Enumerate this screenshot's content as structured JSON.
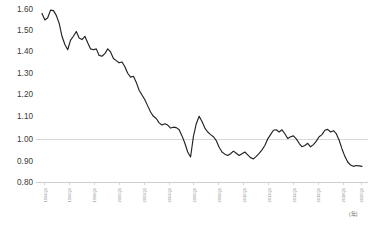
{
  "chart_data": {
    "type": "line",
    "title": "",
    "subtitle": "",
    "xlabel": "(年)",
    "ylabel": "",
    "ylim": [
      0.8,
      1.6
    ],
    "ytick_labels": [
      "1.60",
      "1.50",
      "1.40",
      "1.30",
      "1.20",
      "1.10",
      "1.00",
      "0.90",
      "0.80"
    ],
    "ytick_values": [
      1.6,
      1.5,
      1.4,
      1.3,
      1.2,
      1.1,
      1.0,
      0.9,
      0.8
    ],
    "gridlines": {
      "horizontal_at": [
        1.0,
        0.8
      ],
      "vertical": false
    },
    "legend": {
      "visible": false,
      "position": "none",
      "entries": []
    },
    "xtick_labels": [
      "1994Q1",
      "1996Q1",
      "1998Q1",
      "2000Q1",
      "2002Q1",
      "2004Q1",
      "2006Q1",
      "2008Q1",
      "2010Q1",
      "2012Q1",
      "2014Q1",
      "2016Q1",
      "2018Q1",
      "2020Q1"
    ],
    "xtick_rotation_deg": -90,
    "x_unit_marker": "(年)",
    "series": [
      {
        "name": "index",
        "color": "#222222",
        "x": [
          "1994Q1",
          "1994Q2",
          "1994Q3",
          "1994Q4",
          "1995Q1",
          "1995Q2",
          "1995Q3",
          "1995Q4",
          "1996Q1",
          "1996Q2",
          "1996Q3",
          "1996Q4",
          "1997Q1",
          "1997Q2",
          "1997Q3",
          "1997Q4",
          "1998Q1",
          "1998Q2",
          "1998Q3",
          "1998Q4",
          "1999Q1",
          "1999Q2",
          "1999Q3",
          "1999Q4",
          "2000Q1",
          "2000Q2",
          "2000Q3",
          "2000Q4",
          "2001Q1",
          "2001Q2",
          "2001Q3",
          "2001Q4",
          "2002Q1",
          "2002Q2",
          "2002Q3",
          "2002Q4",
          "2003Q1",
          "2003Q2",
          "2003Q3",
          "2003Q4",
          "2004Q1",
          "2004Q2",
          "2004Q3",
          "2004Q4",
          "2005Q1",
          "2005Q2",
          "2005Q3",
          "2005Q4",
          "2006Q1",
          "2006Q2",
          "2006Q3",
          "2006Q4",
          "2007Q1",
          "2007Q2",
          "2007Q3",
          "2007Q4",
          "2008Q1",
          "2008Q2",
          "2008Q3",
          "2008Q4",
          "2009Q1",
          "2009Q2",
          "2009Q3",
          "2009Q4",
          "2010Q1",
          "2010Q2",
          "2010Q3",
          "2010Q4",
          "2011Q1",
          "2011Q2",
          "2011Q3",
          "2011Q4",
          "2012Q1",
          "2012Q2",
          "2012Q3",
          "2012Q4",
          "2013Q1",
          "2013Q2",
          "2013Q3",
          "2013Q4",
          "2014Q1",
          "2014Q2",
          "2014Q3",
          "2014Q4",
          "2015Q1",
          "2015Q2",
          "2015Q3",
          "2015Q4",
          "2016Q1",
          "2016Q2",
          "2016Q3",
          "2016Q4",
          "2017Q1",
          "2017Q2",
          "2017Q3",
          "2017Q4",
          "2018Q1",
          "2018Q2",
          "2018Q3",
          "2018Q4",
          "2019Q1",
          "2019Q2",
          "2019Q3",
          "2019Q4",
          "2020Q1",
          "2020Q2",
          "2020Q3",
          "2020Q4",
          "2021Q1",
          "2021Q2",
          "2021Q3",
          "2021Q4",
          "2022Q1"
        ],
        "values": [
          1.575,
          1.545,
          1.555,
          1.59,
          1.588,
          1.566,
          1.53,
          1.47,
          1.432,
          1.408,
          1.452,
          1.47,
          1.492,
          1.462,
          1.455,
          1.47,
          1.44,
          1.412,
          1.408,
          1.412,
          1.382,
          1.378,
          1.39,
          1.412,
          1.398,
          1.368,
          1.358,
          1.348,
          1.352,
          1.33,
          1.3,
          1.282,
          1.286,
          1.258,
          1.222,
          1.2,
          1.178,
          1.15,
          1.122,
          1.102,
          1.092,
          1.072,
          1.062,
          1.068,
          1.062,
          1.048,
          1.052,
          1.05,
          1.04,
          1.012,
          0.978,
          0.938,
          0.915,
          1.01,
          1.068,
          1.102,
          1.078,
          1.048,
          1.03,
          1.018,
          1.008,
          0.99,
          0.96,
          0.938,
          0.928,
          0.922,
          0.93,
          0.942,
          0.932,
          0.922,
          0.93,
          0.938,
          0.925,
          0.912,
          0.906,
          0.918,
          0.932,
          0.948,
          0.968,
          0.998,
          1.018,
          1.038,
          1.04,
          1.03,
          1.04,
          1.022,
          1.0,
          1.008,
          1.012,
          0.998,
          0.978,
          0.962,
          0.968,
          0.978,
          0.962,
          0.972,
          0.988,
          1.008,
          1.018,
          1.038,
          1.042,
          1.03,
          1.036,
          1.022,
          0.992,
          0.952,
          0.918,
          0.892,
          0.878,
          0.872,
          0.876,
          0.874,
          0.872
        ]
      }
    ]
  },
  "axes": {
    "y_axis_name": "value-axis",
    "x_axis_name": "time-axis"
  }
}
